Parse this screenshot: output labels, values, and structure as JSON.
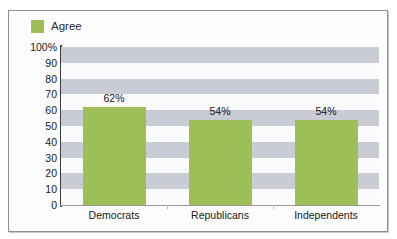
{
  "chart_data": {
    "type": "bar",
    "title": "",
    "subtitle": "",
    "xlabel": "",
    "ylabel": "",
    "categories": [
      "Democrats",
      "Republicans",
      "Independents"
    ],
    "values": [
      62,
      54,
      54
    ],
    "data_labels": [
      "62%",
      "54%",
      "54%"
    ],
    "series": [
      {
        "name": "Agree",
        "values": [
          62,
          54,
          54
        ],
        "color": "#9dbf57"
      }
    ],
    "ylim": [
      0,
      100
    ],
    "ytick_values": [
      100,
      90,
      80,
      70,
      60,
      50,
      40,
      30,
      20,
      10,
      0
    ],
    "ytick_labels": [
      "100%",
      "90",
      "80",
      "70",
      "60",
      "50",
      "40",
      "30",
      "20",
      "10",
      "0"
    ],
    "grid": false,
    "banded_background": true,
    "band_colors": {
      "shaded": "#c9cbd5",
      "plain": "#fbfbfd"
    },
    "legend": {
      "position": "top-left",
      "entries": [
        {
          "label": "Agree",
          "color": "#9dbf57",
          "swatch": "square-swatch"
        }
      ]
    }
  },
  "figure": {
    "border_color": "#8e8e90",
    "background": "#fdfdfd"
  }
}
